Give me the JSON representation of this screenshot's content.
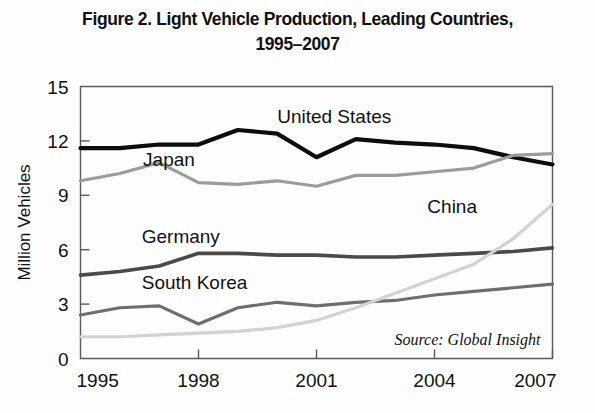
{
  "figure": {
    "title_line1": "Figure 2. Light Vehicle Production, Leading Countries,",
    "title_line2": "1995–2007",
    "source": "Source: Global Insight"
  },
  "chart_data": {
    "type": "line",
    "title": "Figure 2. Light Vehicle Production, Leading Countries, 1995–2007",
    "xlabel": "",
    "ylabel": "Million Vehicles",
    "xlim": [
      1995,
      2007
    ],
    "ylim": [
      0,
      15
    ],
    "yticks": [
      0,
      3,
      6,
      9,
      12,
      15
    ],
    "xticks": [
      1995,
      1998,
      2001,
      2004,
      2007
    ],
    "grid": false,
    "legend": "inline-labels",
    "annotation": "Source: Global Insight",
    "x": [
      1995,
      1996,
      1997,
      1998,
      1999,
      2000,
      2001,
      2002,
      2003,
      2004,
      2005,
      2006,
      2007
    ],
    "series": [
      {
        "name": "United States",
        "color": "#0d0d0d",
        "width": 4.2,
        "label_x": 2001.45,
        "label_y": 13.0,
        "values": [
          11.6,
          11.6,
          11.8,
          11.8,
          12.6,
          12.4,
          11.1,
          12.1,
          11.9,
          11.8,
          11.6,
          11.1,
          10.7
        ]
      },
      {
        "name": "Japan",
        "color": "#9b9b9b",
        "width": 3.2,
        "label_x": 1997.25,
        "label_y": 10.6,
        "values": [
          9.8,
          10.2,
          10.8,
          9.7,
          9.6,
          9.8,
          9.5,
          10.1,
          10.1,
          10.3,
          10.5,
          11.2,
          11.3
        ]
      },
      {
        "name": "Germany",
        "color": "#4a4a4a",
        "width": 3.6,
        "label_x": 1997.55,
        "label_y": 6.35,
        "values": [
          4.6,
          4.8,
          5.1,
          5.8,
          5.8,
          5.7,
          5.7,
          5.6,
          5.6,
          5.7,
          5.8,
          5.9,
          6.1
        ]
      },
      {
        "name": "South Korea",
        "color": "#6e6e6e",
        "width": 3.2,
        "label_x": 1997.9,
        "label_y": 3.85,
        "values": [
          2.4,
          2.8,
          2.9,
          1.9,
          2.8,
          3.1,
          2.9,
          3.1,
          3.2,
          3.5,
          3.7,
          3.9,
          4.1
        ]
      },
      {
        "name": "China",
        "color": "#d2d2d2",
        "width": 3.2,
        "label_x": 2004.45,
        "label_y": 8.0,
        "values": [
          1.2,
          1.2,
          1.3,
          1.4,
          1.5,
          1.7,
          2.1,
          2.8,
          3.6,
          4.4,
          5.2,
          6.6,
          8.5
        ]
      }
    ]
  },
  "icons": {
    "chart_icon": "line-chart-icon"
  }
}
